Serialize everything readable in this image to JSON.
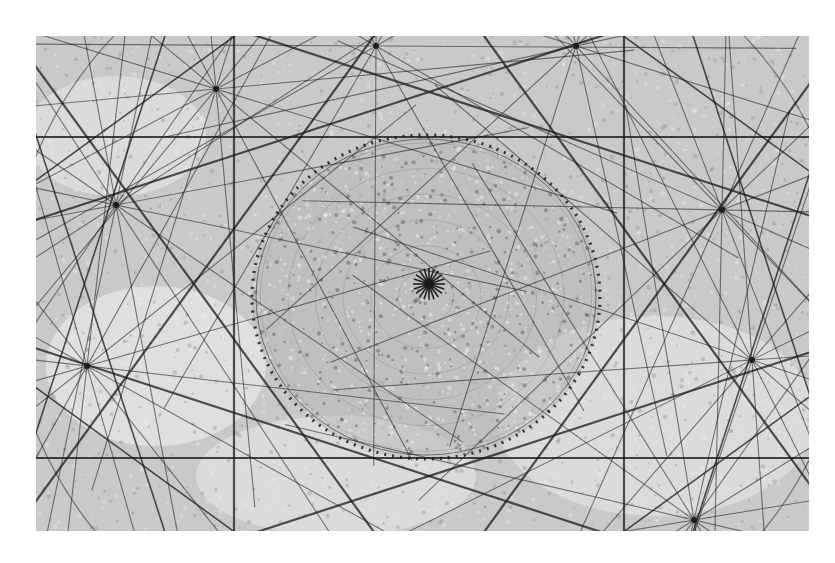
{
  "figure": {
    "frame": {
      "x": 36,
      "y": 36,
      "width": 773,
      "height": 495
    },
    "colors": {
      "background": "#c9c9c9",
      "light_patch": "#e8e8e8",
      "line": "#1a1a1a",
      "disk": "#b5b5b5"
    },
    "center": {
      "x": 393,
      "y": 248
    },
    "disk": {
      "cx": 390,
      "cy": 261,
      "rx": 174,
      "ry": 162
    },
    "horizontal_bands_y": [
      101,
      422
    ],
    "star_nodes": [
      {
        "x": 393,
        "y": 248,
        "rays": 10
      },
      {
        "x": 180,
        "y": 53,
        "rays": 8
      },
      {
        "x": 80,
        "y": 169,
        "rays": 8
      },
      {
        "x": 51,
        "y": 330,
        "rays": 8
      },
      {
        "x": 686,
        "y": 174,
        "rays": 8
      },
      {
        "x": 716,
        "y": 324,
        "rays": 8
      },
      {
        "x": 658,
        "y": 484,
        "rays": 8
      },
      {
        "x": 340,
        "y": 10,
        "rays": 6
      },
      {
        "x": 540,
        "y": 10,
        "rays": 6
      }
    ]
  },
  "caption": {
    "text": ""
  }
}
